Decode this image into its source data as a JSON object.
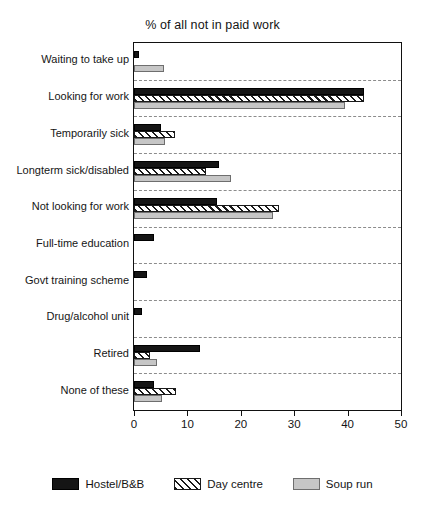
{
  "chart_data": {
    "type": "bar",
    "orientation": "horizontal",
    "title": "% of all not in paid work",
    "xlabel": "",
    "ylabel": "",
    "xlim": [
      0,
      50
    ],
    "xticks": [
      0,
      10,
      20,
      30,
      40,
      50
    ],
    "xticklabels": [
      "0",
      "10",
      "20",
      "30",
      "40",
      "50"
    ],
    "grid": "horizontal-dashed",
    "legend_position": "bottom-center",
    "categories": [
      "Waiting to take up",
      "Looking for work",
      "Temporarily sick",
      "Longterm sick/disabled",
      "Not looking for work",
      "Full-time education",
      "Govt training scheme",
      "Drug/alcohol unit",
      "Retired",
      "None of these"
    ],
    "series": [
      {
        "name": "Hostel/B&B",
        "color": "#151515",
        "pattern": "solid",
        "values": [
          1,
          43,
          5,
          16,
          15.5,
          3.7,
          2.5,
          1.4,
          12.4,
          3.7
        ]
      },
      {
        "name": "Day centre",
        "color": "#ffffff",
        "pattern": "diagonal-hatch",
        "values": [
          0,
          43,
          7.7,
          13.5,
          27.2,
          0,
          0,
          0,
          3,
          7.8
        ]
      },
      {
        "name": "Soup run",
        "color": "#c6c6c6",
        "pattern": "solid",
        "values": [
          5.7,
          39.5,
          5.8,
          18.2,
          26.1,
          0,
          0,
          0,
          4.3,
          5.2
        ]
      }
    ]
  },
  "legend": {
    "entries": [
      {
        "label": "Hostel/B&B"
      },
      {
        "label": "Day centre"
      },
      {
        "label": "Soup run"
      }
    ]
  }
}
